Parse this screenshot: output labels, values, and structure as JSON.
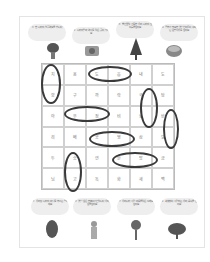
{
  "top_clues": [
    {
      "text": "① 한 나라의 얼굴 역할을 합니다"
    },
    {
      "text": "② 나라의 말과 역사를 담은 곳이 있어요"
    },
    {
      "text": "③ 빨간 꽃잎 가득한 우리 나라의 꽃 이름을 찾아요"
    },
    {
      "text": "④ 공부가 필요한 옛날 선비들이 꾸미던 문방사우를 찾아요"
    }
  ],
  "bottom_clues": [
    {
      "text": "⑤ 우리 땅 나라의 바닷물 부르는 말이에요"
    },
    {
      "text": "⑥ 옛날 옷은 한복이 기본입니다 우리 옷을 찾아요"
    },
    {
      "text": "⑦ 우리나라 사람 마음을 담은 노래를 찾아요"
    },
    {
      "text": "⑧ 세계 많이 사랑하는 우리 음식을 찾아요"
    }
  ],
  "grid": [
    [
      "치",
      "용",
      "도",
      "읍",
      "내",
      "도"
    ],
    [
      "향",
      "구",
      "까",
      "락",
      "국",
      "탐"
    ],
    [
      "아",
      "우",
      "정",
      "비",
      "보",
      "반"
    ],
    [
      "리",
      "배",
      "공",
      "영",
      "삼",
      "도"
    ],
    [
      "두",
      "승",
      "연",
      "한",
      "방",
      "금"
    ],
    [
      "님",
      "고",
      "독",
      "화",
      "새",
      "백"
    ]
  ],
  "colors": {
    "oval": "#3a3a3a",
    "grid_line": "#d0d0d0",
    "bubble": "#eeeeee"
  }
}
